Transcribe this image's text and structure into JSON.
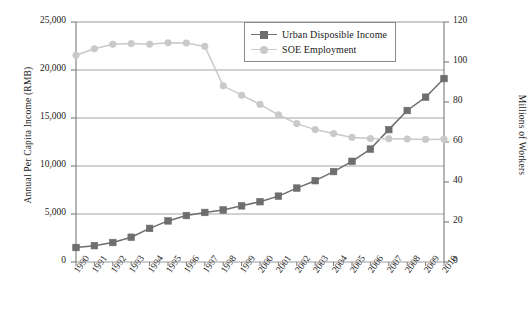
{
  "chart_data": {
    "type": "line",
    "title": "",
    "xlabel": "",
    "ylabel": "Annual Per Capita Income (RMB)",
    "y2label": "Millions of Workers",
    "categories": [
      "1990",
      "1991",
      "1992",
      "1993",
      "1994",
      "1995",
      "1996",
      "1997",
      "1998",
      "1999",
      "2000",
      "2001",
      "2002",
      "2003",
      "2004",
      "2005",
      "2006",
      "2007",
      "2008",
      "2009",
      "2010"
    ],
    "ylim": [
      0,
      25000
    ],
    "y2lim": [
      0,
      120
    ],
    "yticks": [
      "0",
      "5,000",
      "10,000",
      "15,000",
      "20,000",
      "25,000"
    ],
    "y2ticks": [
      "0",
      "20",
      "40",
      "60",
      "80",
      "100",
      "120"
    ],
    "grid": true,
    "legend_position": "top-center-right",
    "series": [
      {
        "name": "Urban Disposible Income",
        "axis": "left",
        "color": "#6e6e6e",
        "marker": "square",
        "values": [
          1510,
          1700,
          2030,
          2580,
          3500,
          4280,
          4840,
          5160,
          5420,
          5850,
          6280,
          6860,
          7700,
          8470,
          9420,
          10490,
          11760,
          13790,
          15780,
          17170,
          19110
        ]
      },
      {
        "name": "SOE Employment",
        "axis": "right",
        "color": "#c9c9c9",
        "marker": "circle",
        "values": [
          103.4,
          106.6,
          108.9,
          109.2,
          108.9,
          109.6,
          109.5,
          107.8,
          88.1,
          83.4,
          78.8,
          73.6,
          69.2,
          66.2,
          64.2,
          62.3,
          61.7,
          61.6,
          61.5,
          61.3,
          61.4
        ]
      }
    ]
  },
  "axes": {
    "left_title": "Annual Per Capita Income (RMB)",
    "right_title": "Millions of Workers"
  },
  "legend": {
    "items": [
      {
        "label": "Urban Disposible Income"
      },
      {
        "label": "SOE Employment"
      }
    ]
  }
}
